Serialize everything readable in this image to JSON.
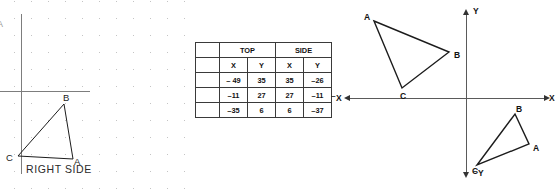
{
  "left_panel": {
    "name": "right-side-view-panel",
    "caption": "RIGHT SIDE",
    "corner_mark": "A",
    "grid": "dot-grid",
    "triangle": {
      "vertices": [
        {
          "label": "B",
          "x": 64,
          "y": 104
        },
        {
          "label": "C",
          "x": 18,
          "y": 156
        },
        {
          "label": "A",
          "x": 73,
          "y": 159
        }
      ],
      "label_positions": [
        {
          "label": "B",
          "x": 63,
          "y": 92
        },
        {
          "label": "C",
          "x": 6,
          "y": 152
        },
        {
          "label": "A",
          "x": 74,
          "y": 156
        }
      ]
    }
  },
  "table": {
    "name": "top-side-coordinate-table",
    "group_headers": [
      "",
      "TOP",
      "SIDE"
    ],
    "sub_headers": [
      "",
      "X",
      "Y",
      "X",
      "Y"
    ],
    "rows": [
      {
        "label": "",
        "top_x": "– 49",
        "top_y": "35",
        "side_x": "35",
        "side_y": "–26"
      },
      {
        "label": "",
        "top_x": "–11",
        "top_y": "27",
        "side_x": "27",
        "side_y": "–11"
      },
      {
        "label": "",
        "top_x": "–35",
        "top_y": "6",
        "side_x": "6",
        "side_y": "–37"
      }
    ]
  },
  "plane": {
    "name": "cartesian-plane",
    "axis_labels": {
      "x_positive": "X",
      "x_negative": "⁻X",
      "y_positive": "Y",
      "y_negative": "⁻Y"
    },
    "triangle_upper_left": {
      "name": "triangle-quadrant-two",
      "vertices": [
        {
          "label": "A",
          "x": 44,
          "y": 21
        },
        {
          "label": "B",
          "x": 119,
          "y": 52
        },
        {
          "label": "C",
          "x": 72,
          "y": 88
        }
      ],
      "label_positions": [
        {
          "label": "A",
          "x": 34,
          "y": 12
        },
        {
          "label": "B",
          "x": 124,
          "y": 50
        },
        {
          "label": "C",
          "x": 70,
          "y": 91
        }
      ]
    },
    "triangle_lower_right": {
      "name": "triangle-quadrant-four",
      "vertices": [
        {
          "label": "B",
          "x": 185,
          "y": 114
        },
        {
          "label": "A",
          "x": 199,
          "y": 144
        },
        {
          "label": "C",
          "x": 147,
          "y": 165
        }
      ],
      "label_positions": [
        {
          "label": "B",
          "x": 186,
          "y": 104
        },
        {
          "label": "A",
          "x": 203,
          "y": 143
        },
        {
          "label": "C",
          "x": 142,
          "y": 166
        }
      ]
    }
  },
  "colors": {
    "stroke": "#1c1c1c",
    "axis": "#5a5a5a",
    "grid_dot": "#b9b9b9",
    "table_border": "#3a3a3a"
  }
}
